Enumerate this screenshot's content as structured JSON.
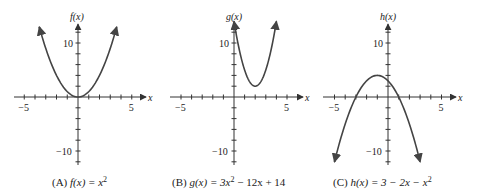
{
  "chart_data": [
    {
      "type": "line",
      "panel": "A",
      "caption": "(A)  f(x) = x²",
      "caption_label": "(A)",
      "caption_func": "f(x) = x",
      "caption_sup": "2",
      "ylabel": "f(x)",
      "xlabel": "x",
      "xlim": [
        -5.5,
        6
      ],
      "ylim": [
        -12,
        13
      ],
      "xticks": [
        -5,
        5
      ],
      "yticks": [
        10,
        -10
      ],
      "x_tick_labels": [
        "−5",
        "5"
      ],
      "y_tick_labels": [
        "10",
        "−10"
      ],
      "expression": "x^2",
      "x": [
        -3.6,
        -3,
        -2,
        -1,
        0,
        1,
        2,
        3,
        3.6
      ],
      "y": [
        12.96,
        9,
        4,
        1,
        0,
        1,
        4,
        9,
        12.96
      ]
    },
    {
      "type": "line",
      "panel": "B",
      "caption": "(B)  g(x) = 3x² − 12x + 14",
      "caption_label": "(B)",
      "caption_func": "g(x) = 3x",
      "caption_sup": "2",
      "caption_rest": " − 12x + 14",
      "ylabel": "g(x)",
      "xlabel": "x",
      "xlim": [
        -5.5,
        6
      ],
      "ylim": [
        -12,
        13
      ],
      "xticks": [
        -5,
        5
      ],
      "yticks": [
        10,
        -10
      ],
      "x_tick_labels": [
        "−5",
        "5"
      ],
      "y_tick_labels": [
        "10",
        "−10"
      ],
      "expression": "3x^2 - 12x + 14",
      "x": [
        0,
        0.5,
        1,
        1.5,
        2,
        2.5,
        3,
        3.5,
        4
      ],
      "y": [
        14,
        8.75,
        5,
        2.75,
        2,
        2.75,
        5,
        8.75,
        14
      ]
    },
    {
      "type": "line",
      "panel": "C",
      "caption": "(C)  h(x) = 3 − 2x − x²",
      "caption_label": "(C)",
      "caption_func": "h(x) = 3 − 2x − x",
      "caption_sup": "2",
      "ylabel": "h(x)",
      "xlabel": "x",
      "xlim": [
        -5.5,
        6
      ],
      "ylim": [
        -13,
        13
      ],
      "xticks": [
        -5,
        5
      ],
      "yticks": [
        10,
        -10
      ],
      "x_tick_labels": [
        "−5",
        "5"
      ],
      "y_tick_labels": [
        "10",
        "−10"
      ],
      "expression": "3 - 2x - x^2",
      "x": [
        -5,
        -4,
        -3,
        -2,
        -1,
        0,
        1,
        2,
        3
      ],
      "y": [
        -12,
        -5,
        0,
        3,
        4,
        3,
        0,
        -5,
        -12
      ]
    }
  ]
}
